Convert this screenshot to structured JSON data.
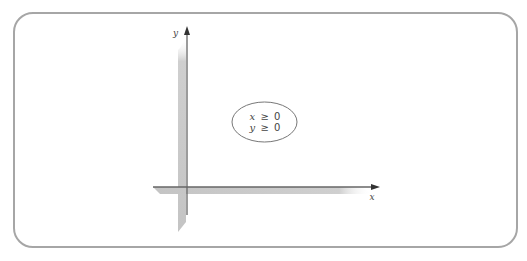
{
  "diagram": {
    "type": "coordinate-plane-first-quadrant",
    "axes": {
      "x": {
        "label": "x"
      },
      "y": {
        "label": "y"
      }
    },
    "region_label": {
      "lines": [
        {
          "var": "x",
          "op": "≥",
          "value": "0"
        },
        {
          "var": "y",
          "op": "≥",
          "value": "0"
        }
      ]
    },
    "colors": {
      "frame": "#a6a6a6",
      "axis_line": "#555555",
      "axis_band": "#c8c8c8",
      "ellipse": "#777777",
      "text": "#444444"
    }
  }
}
